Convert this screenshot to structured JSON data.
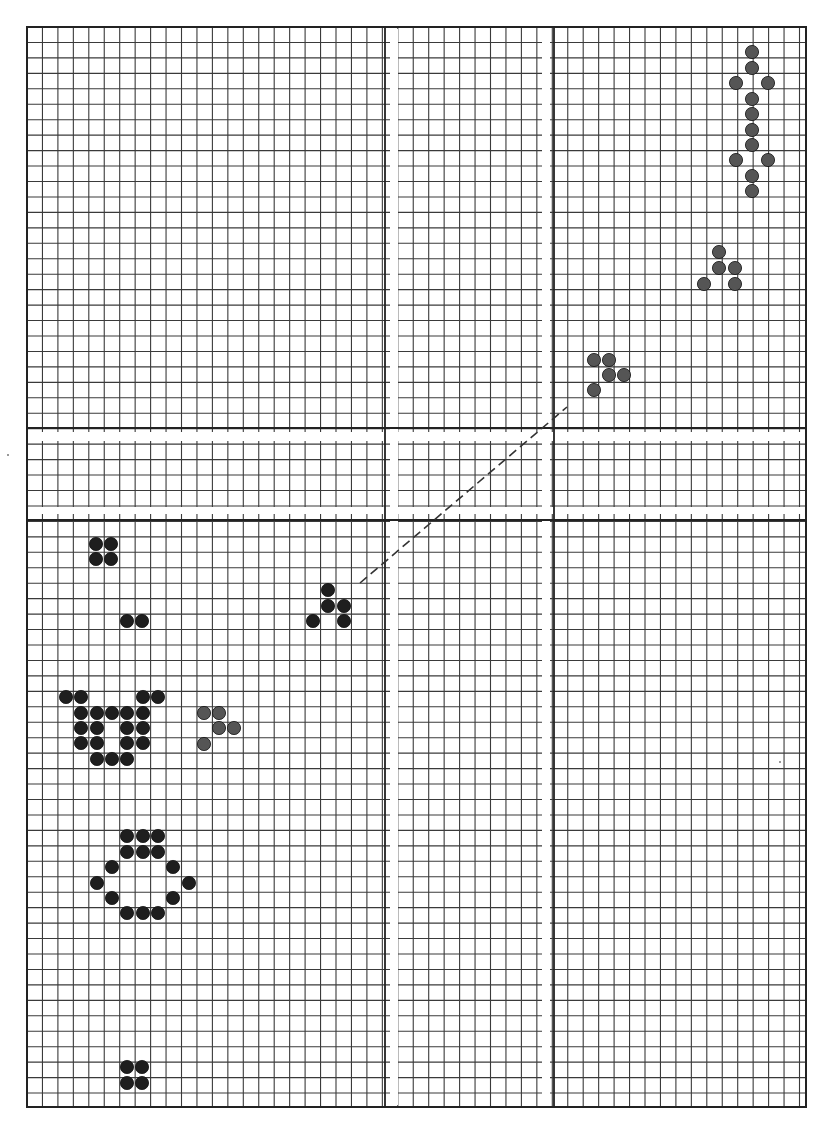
{
  "board": {
    "title": "Life pattern grid",
    "grid": {
      "left": 27,
      "top": 27,
      "right": 806,
      "bottom": 1107,
      "pitch": 15.45,
      "line_color": "#3a3a3a",
      "border_color": "#222222",
      "thick_lines": {
        "vertical": [
          385,
          554
        ],
        "horizontal": [
          428,
          520
        ]
      },
      "crease_bands": {
        "vertical": [
          [
            390,
            398
          ],
          [
            542,
            550
          ]
        ],
        "horizontal": [
          [
            432,
            441
          ],
          [
            507,
            514
          ]
        ]
      }
    },
    "dot_radius": 6.6,
    "colors": {
      "black": "#1e1e1e",
      "gray": "#555555"
    },
    "patterns": [
      {
        "name": "vertical-spaceship",
        "color": "gray",
        "cells": [
          [
            752,
            52
          ],
          [
            752,
            68
          ],
          [
            736,
            83
          ],
          [
            768,
            83
          ],
          [
            752,
            99
          ],
          [
            752,
            114
          ],
          [
            752,
            130
          ],
          [
            752,
            145
          ],
          [
            736,
            160
          ],
          [
            768,
            160
          ],
          [
            752,
            176
          ],
          [
            752,
            191
          ]
        ]
      },
      {
        "name": "glider-upper-right",
        "color": "gray",
        "cells": [
          [
            719,
            252
          ],
          [
            719,
            268
          ],
          [
            735,
            268
          ],
          [
            704,
            284
          ],
          [
            735,
            284
          ]
        ]
      },
      {
        "name": "glider-center-right",
        "color": "gray",
        "cells": [
          [
            594,
            360
          ],
          [
            609,
            360
          ],
          [
            609,
            375
          ],
          [
            624,
            375
          ],
          [
            594,
            390
          ]
        ]
      },
      {
        "name": "block-left",
        "color": "black",
        "cells": [
          [
            96,
            544
          ],
          [
            111,
            544
          ],
          [
            96,
            559
          ],
          [
            111,
            559
          ]
        ]
      },
      {
        "name": "pair-left",
        "color": "black",
        "cells": [
          [
            127,
            621
          ],
          [
            142,
            621
          ]
        ]
      },
      {
        "name": "glider-center-left",
        "color": "black",
        "cells": [
          [
            328,
            590
          ],
          [
            328,
            606
          ],
          [
            344,
            606
          ],
          [
            313,
            621
          ],
          [
            344,
            621
          ]
        ]
      },
      {
        "name": "cup-shape",
        "color": "black",
        "cells": [
          [
            66,
            697
          ],
          [
            81,
            697
          ],
          [
            143,
            697
          ],
          [
            158,
            697
          ],
          [
            81,
            713
          ],
          [
            97,
            713
          ],
          [
            112,
            713
          ],
          [
            127,
            713
          ],
          [
            143,
            713
          ],
          [
            81,
            728
          ],
          [
            97,
            728
          ],
          [
            127,
            728
          ],
          [
            143,
            728
          ],
          [
            81,
            743
          ],
          [
            97,
            743
          ],
          [
            127,
            743
          ],
          [
            143,
            743
          ],
          [
            97,
            759
          ],
          [
            112,
            759
          ],
          [
            127,
            759
          ]
        ]
      },
      {
        "name": "glider-mid-left",
        "color": "gray",
        "cells": [
          [
            204,
            713
          ],
          [
            219,
            713
          ],
          [
            219,
            728
          ],
          [
            234,
            728
          ],
          [
            204,
            744
          ]
        ]
      },
      {
        "name": "ring-shape",
        "color": "black",
        "cells": [
          [
            127,
            836
          ],
          [
            143,
            836
          ],
          [
            158,
            836
          ],
          [
            127,
            852
          ],
          [
            143,
            852
          ],
          [
            158,
            852
          ],
          [
            112,
            867
          ],
          [
            173,
            867
          ],
          [
            97,
            883
          ],
          [
            189,
            883
          ],
          [
            112,
            898
          ],
          [
            173,
            898
          ],
          [
            127,
            913
          ],
          [
            143,
            913
          ],
          [
            158,
            913
          ]
        ]
      },
      {
        "name": "block-bottom",
        "color": "black",
        "cells": [
          [
            127,
            1067
          ],
          [
            142,
            1067
          ],
          [
            127,
            1083
          ],
          [
            142,
            1083
          ]
        ]
      }
    ],
    "dashed_line": {
      "x1": 360,
      "y1": 583,
      "x2": 567,
      "y2": 407,
      "color": "#333333",
      "dash": "9 5",
      "width": 1.6
    },
    "stray_marks": [
      [
        8,
        455
      ],
      [
        780,
        762
      ]
    ]
  }
}
